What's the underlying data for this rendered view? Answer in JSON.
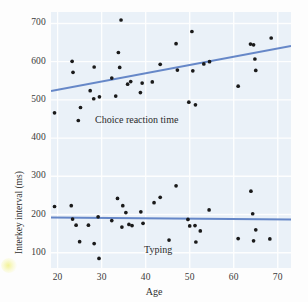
{
  "chart_data": {
    "type": "scatter",
    "title": "",
    "xlabel": "Age",
    "ylabel": "Interkey interval (ms)",
    "xlim": [
      18.5,
      73
    ],
    "ylim": [
      60,
      730
    ],
    "xticks": [
      20,
      30,
      40,
      50,
      60,
      70
    ],
    "yticks": [
      100,
      200,
      300,
      400,
      500,
      600,
      700
    ],
    "grid": true,
    "legend": "inline-annotations",
    "plot_background_color": "#eaf1f8",
    "gridline_color": "#ffffff",
    "point_color": "#1a1a1a",
    "trendline_color": "#5b7fc4",
    "annotations": [
      {
        "text": "Choice reaction time",
        "x": 38.5,
        "y": 445
      },
      {
        "text": "Typing",
        "x": 43.5,
        "y": 105
      }
    ],
    "series": [
      {
        "name": "Choice reaction time",
        "color": "#1a1a1a",
        "trendline": {
          "x": [
            18.5,
            73
          ],
          "y": [
            523,
            641
          ],
          "color": "#5b7fc4"
        },
        "points": [
          [
            19.3,
            466
          ],
          [
            23.3,
            601
          ],
          [
            23.5,
            572
          ],
          [
            24.7,
            446
          ],
          [
            25.2,
            480
          ],
          [
            27.4,
            524
          ],
          [
            28.2,
            503
          ],
          [
            28.3,
            586
          ],
          [
            29.5,
            508
          ],
          [
            32.3,
            557
          ],
          [
            33.2,
            510
          ],
          [
            33.8,
            624
          ],
          [
            34.1,
            585
          ],
          [
            34.4,
            709
          ],
          [
            35.9,
            541
          ],
          [
            36.6,
            548
          ],
          [
            38.8,
            519
          ],
          [
            39.2,
            544
          ],
          [
            41.5,
            547
          ],
          [
            43.3,
            593
          ],
          [
            46.9,
            647
          ],
          [
            47.2,
            578
          ],
          [
            49.8,
            494
          ],
          [
            50.5,
            679
          ],
          [
            50.7,
            576
          ],
          [
            51.3,
            487
          ],
          [
            53.2,
            594
          ],
          [
            54.5,
            600
          ],
          [
            61.0,
            536
          ],
          [
            63.8,
            646
          ],
          [
            64.5,
            644
          ],
          [
            64.8,
            607
          ],
          [
            65.0,
            577
          ],
          [
            68.5,
            662
          ]
        ]
      },
      {
        "name": "Typing",
        "color": "#1a1a1a",
        "trendline": {
          "x": [
            18.5,
            73
          ],
          "y": [
            192,
            187
          ],
          "color": "#5b7fc4"
        },
        "points": [
          [
            19.3,
            221
          ],
          [
            23.1,
            223
          ],
          [
            23.4,
            188
          ],
          [
            24.2,
            172
          ],
          [
            25.0,
            129
          ],
          [
            27.0,
            172
          ],
          [
            28.3,
            124
          ],
          [
            29.2,
            194
          ],
          [
            29.4,
            85
          ],
          [
            32.3,
            184
          ],
          [
            33.6,
            242
          ],
          [
            34.6,
            167
          ],
          [
            34.8,
            223
          ],
          [
            35.5,
            205
          ],
          [
            36.2,
            174
          ],
          [
            36.9,
            171
          ],
          [
            38.9,
            207
          ],
          [
            39.4,
            177
          ],
          [
            41.9,
            231
          ],
          [
            43.3,
            245
          ],
          [
            45.3,
            133
          ],
          [
            46.9,
            275
          ],
          [
            49.6,
            187
          ],
          [
            50.0,
            170
          ],
          [
            51.2,
            171
          ],
          [
            51.4,
            128
          ],
          [
            52.4,
            157
          ],
          [
            54.4,
            212
          ],
          [
            61.0,
            137
          ],
          [
            63.9,
            261
          ],
          [
            64.3,
            202
          ],
          [
            64.5,
            131
          ],
          [
            65.0,
            160
          ],
          [
            68.2,
            136
          ]
        ]
      }
    ]
  },
  "axes": {
    "x_tick_labels": [
      "20",
      "30",
      "40",
      "50",
      "60",
      "70"
    ],
    "y_tick_labels": [
      "100",
      "200",
      "300",
      "400",
      "500",
      "600",
      "700"
    ],
    "x_title": "Age",
    "y_title": "Interkey interval (ms)"
  },
  "labels": {
    "upper_series": "Choice reaction time",
    "lower_series": "Typing"
  }
}
